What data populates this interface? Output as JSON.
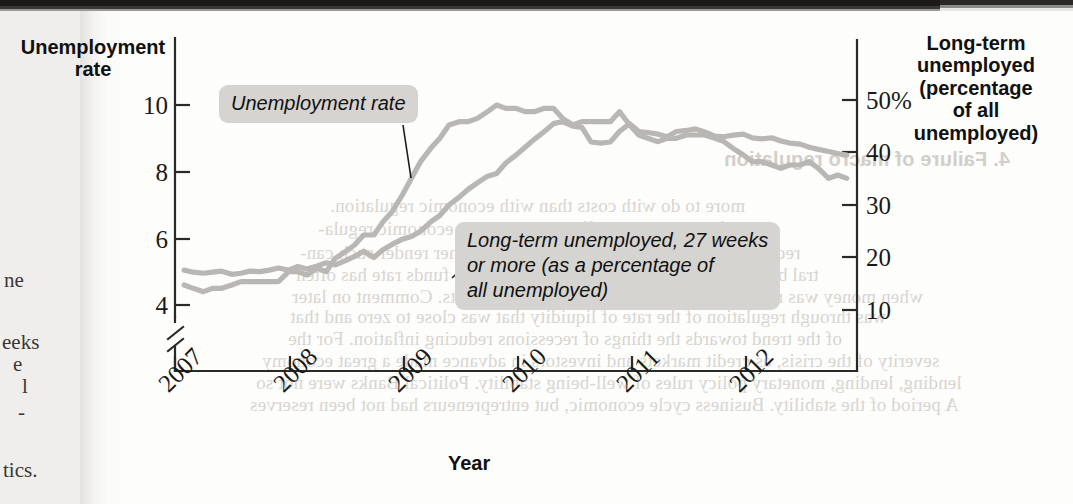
{
  "page": {
    "margin_fragments": [
      {
        "text": "ne",
        "x": 4,
        "y": 268
      },
      {
        "text": "eeks",
        "x": 2,
        "y": 330
      },
      {
        "text": "e",
        "x": 13,
        "y": 352
      },
      {
        "text": "l",
        "x": 22,
        "y": 374
      },
      {
        "text": "-",
        "x": 18,
        "y": 400
      },
      {
        "text": "tics.",
        "x": 3,
        "y": 458
      }
    ],
    "bleed_lines": [
      {
        "text": "4. Failure of macro regulation",
        "x": 724,
        "y": 148,
        "head": true
      },
      {
        "text": "more to do with costs than with economic regulation.",
        "x": 330,
        "y": 195
      },
      {
        "text": "inflation, and the effect was made in economic regula-",
        "x": 318,
        "y": 218
      },
      {
        "text": "recovery and a long fall in output and the other render such can-",
        "x": 300,
        "y": 242
      },
      {
        "text": "tral banks. The policy rate is set in a range, the funds rate has often",
        "x": 296,
        "y": 264
      },
      {
        "text": "when money was not even higher growth in financial markets. Comment on later",
        "x": 292,
        "y": 286
      },
      {
        "text": "was through regulation of the rate of liquidity that was close to zero and that",
        "x": 290,
        "y": 306
      },
      {
        "text": "of the trend towards the things of recessions reducing inflation. For the",
        "x": 288,
        "y": 328
      },
      {
        "text": "severity of the crisis, as credit markets and investors in advance made a great economy",
        "x": 262,
        "y": 350
      },
      {
        "text": "lending, lending, monetary policy rules of well-being stability. Political Banks were not so",
        "x": 256,
        "y": 372
      },
      {
        "text": "A period of the stability. Business cycle economic, but entrepreneurs had not been reserves",
        "x": 250,
        "y": 394
      }
    ]
  },
  "chart_data": {
    "type": "line",
    "title": "",
    "xlabel": "Year",
    "ylabel_left": "Unemployment\nrate",
    "ylabel_right": "Long-term\nunemployed\n(percentage\nof all\nunemployed)",
    "grid": false,
    "legend": "annotations",
    "x_ticks": [
      "2007",
      "2008",
      "2009",
      "2010",
      "2011",
      "2012"
    ],
    "x_tick_values": [
      2007,
      2008,
      2009,
      2010,
      2011,
      2012
    ],
    "xlim": [
      2006.92,
      2012.92
    ],
    "left_axis": {
      "ticks": [
        "10",
        "8",
        "6",
        "4"
      ],
      "tick_values": [
        10,
        8,
        6,
        4
      ],
      "ylim": [
        3.1,
        11.2
      ],
      "broken_axis": true
    },
    "right_axis": {
      "ticks": [
        "50%",
        "40",
        "30",
        "20",
        "10"
      ],
      "tick_values": [
        50,
        40,
        30,
        20,
        10
      ],
      "ylim": [
        2,
        58
      ]
    },
    "series": [
      {
        "name": "Unemployment rate",
        "axis": "left",
        "units": "percent",
        "color": "#b9b7b3",
        "x": [
          2007.0,
          2007.08,
          2007.17,
          2007.25,
          2007.33,
          2007.42,
          2007.5,
          2007.58,
          2007.67,
          2007.75,
          2007.83,
          2007.92,
          2008.0,
          2008.08,
          2008.17,
          2008.25,
          2008.33,
          2008.42,
          2008.5,
          2008.58,
          2008.67,
          2008.75,
          2008.83,
          2008.92,
          2009.0,
          2009.08,
          2009.17,
          2009.25,
          2009.33,
          2009.42,
          2009.5,
          2009.58,
          2009.67,
          2009.75,
          2009.83,
          2009.92,
          2010.0,
          2010.08,
          2010.17,
          2010.25,
          2010.33,
          2010.42,
          2010.5,
          2010.58,
          2010.67,
          2010.75,
          2010.83,
          2010.92,
          2011.0,
          2011.08,
          2011.17,
          2011.25,
          2011.33,
          2011.42,
          2011.5,
          2011.58,
          2011.67,
          2011.75,
          2011.83,
          2011.92,
          2012.0,
          2012.08,
          2012.17,
          2012.25,
          2012.33,
          2012.42,
          2012.5,
          2012.58,
          2012.67,
          2012.75,
          2012.83
        ],
        "values": [
          4.6,
          4.5,
          4.4,
          4.5,
          4.5,
          4.6,
          4.7,
          4.7,
          4.7,
          4.7,
          4.7,
          5.0,
          5.0,
          4.9,
          5.1,
          5.0,
          5.4,
          5.6,
          5.8,
          6.1,
          6.1,
          6.5,
          6.8,
          7.3,
          7.8,
          8.3,
          8.7,
          9.0,
          9.4,
          9.5,
          9.5,
          9.6,
          9.8,
          10.0,
          9.9,
          9.9,
          9.8,
          9.8,
          9.9,
          9.9,
          9.6,
          9.4,
          9.5,
          9.5,
          9.5,
          9.5,
          9.8,
          9.4,
          9.1,
          9.0,
          8.9,
          9.0,
          9.0,
          9.1,
          9.1,
          9.1,
          9.0,
          8.9,
          8.7,
          8.5,
          8.3,
          8.3,
          8.2,
          8.1,
          8.2,
          8.2,
          8.3,
          8.1,
          7.8,
          7.9,
          7.8
        ]
      },
      {
        "name": "Long-term unemployed, 27 weeks or more (as a percentage of all unemployed)",
        "axis": "right",
        "units": "percent of all unemployed",
        "color": "#b9b7b3",
        "x": [
          2007.0,
          2007.08,
          2007.17,
          2007.25,
          2007.33,
          2007.42,
          2007.5,
          2007.58,
          2007.67,
          2007.75,
          2007.83,
          2007.92,
          2008.0,
          2008.08,
          2008.17,
          2008.25,
          2008.33,
          2008.42,
          2008.5,
          2008.58,
          2008.67,
          2008.75,
          2008.83,
          2008.92,
          2009.0,
          2009.08,
          2009.17,
          2009.25,
          2009.33,
          2009.42,
          2009.5,
          2009.58,
          2009.67,
          2009.75,
          2009.83,
          2009.92,
          2010.0,
          2010.08,
          2010.17,
          2010.25,
          2010.33,
          2010.42,
          2010.5,
          2010.58,
          2010.67,
          2010.75,
          2010.83,
          2010.92,
          2011.0,
          2011.08,
          2011.17,
          2011.25,
          2011.33,
          2011.42,
          2011.5,
          2011.58,
          2011.67,
          2011.75,
          2011.83,
          2011.92,
          2012.0,
          2012.08,
          2012.17,
          2012.25,
          2012.33,
          2012.42,
          2012.5,
          2012.58,
          2012.67,
          2012.75,
          2012.83
        ],
        "values": [
          17.6,
          17.2,
          17.0,
          17.2,
          17.4,
          16.8,
          17.0,
          17.4,
          17.3,
          17.6,
          18.0,
          17.6,
          18.3,
          17.8,
          18.4,
          19.0,
          18.6,
          19.4,
          20.2,
          21.2,
          20.0,
          21.5,
          22.5,
          23.5,
          24.0,
          25.0,
          26.8,
          28.0,
          30.0,
          31.5,
          33.0,
          34.2,
          35.5,
          36.0,
          38.0,
          39.5,
          41.0,
          42.5,
          44.0,
          45.5,
          45.9,
          45.0,
          44.8,
          42.0,
          41.8,
          42.0,
          44.0,
          45.5,
          44.0,
          43.8,
          43.5,
          43.0,
          44.0,
          44.2,
          44.5,
          43.9,
          43.1,
          43.0,
          43.3,
          43.5,
          42.8,
          42.6,
          42.8,
          42.2,
          41.8,
          41.6,
          41.0,
          40.6,
          40.2,
          39.8,
          39.5
        ]
      }
    ],
    "annotations": [
      {
        "id": "callout-unemployment",
        "text": "Unemployment rate"
      },
      {
        "id": "callout-longterm",
        "text": "Long-term unemployed, 27 weeks\nor more (as a percentage of\nall unemployed)"
      }
    ]
  },
  "axis_titles": {
    "left": "Unemployment\nrate",
    "right": "Long-term\nunemployed\n(percentage\nof all\nunemployed)",
    "x": "Year"
  },
  "left_ticks": [
    {
      "label": "10",
      "y": 92
    },
    {
      "label": "8",
      "y": 159
    },
    {
      "label": "6",
      "y": 226
    },
    {
      "label": "4",
      "y": 292
    }
  ],
  "right_ticks": [
    {
      "label": "50%",
      "y": 87
    },
    {
      "label": "40",
      "y": 139
    },
    {
      "label": "30",
      "y": 192
    },
    {
      "label": "20",
      "y": 244
    },
    {
      "label": "10",
      "y": 297
    }
  ],
  "x_ticks": [
    {
      "label": "2007",
      "x": 153,
      "y": 378
    },
    {
      "label": "2008",
      "x": 268,
      "y": 378
    },
    {
      "label": "2009",
      "x": 383,
      "y": 378
    },
    {
      "label": "2010",
      "x": 497,
      "y": 378
    },
    {
      "label": "2011",
      "x": 611,
      "y": 378
    },
    {
      "label": "2012",
      "x": 724,
      "y": 378
    }
  ],
  "colors": {
    "series_line": "#b9b7b3",
    "axis": "#2b2926",
    "callout_bg": "#d6d4d1",
    "page": "#fdfdfc",
    "text": "#101010"
  }
}
